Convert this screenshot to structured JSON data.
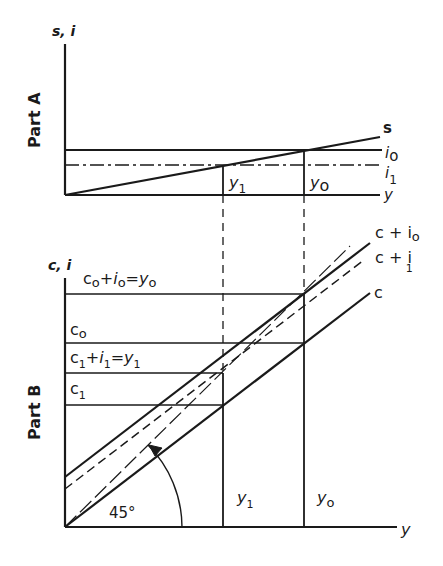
{
  "part_a": {
    "panel_label": "Part A",
    "y_axis_label": "s, i",
    "x_axis_label": "y",
    "curves": {
      "s": "s",
      "i0_main": "i",
      "i0_sub": "o",
      "i1_main": "i",
      "i1_sub": "1"
    },
    "markers": {
      "y1_main": "y",
      "y1_sub": "1",
      "y0_main": "y",
      "y0_sub": "o"
    }
  },
  "part_b": {
    "panel_label": "Part B",
    "y_axis_label": "c, i",
    "x_axis_label": "y",
    "levels": {
      "top": [
        "c",
        "o",
        "+",
        "i",
        "o",
        "=",
        "y",
        "o"
      ],
      "c0": [
        "c",
        "o"
      ],
      "mid": [
        "c",
        "1",
        "+",
        "i",
        "1",
        "=",
        "y",
        "1"
      ],
      "c1": [
        "c",
        "1"
      ]
    },
    "curves": {
      "c_plus_i0": "c + i",
      "c_plus_i0_sub": "o",
      "c_plus_i1": "c + i",
      "c_plus_i1_sub": "1",
      "c": "c"
    },
    "angle_label": "45°",
    "markers": {
      "y1_main": "y",
      "y1_sub": "1",
      "y0_main": "y",
      "y0_sub": "o"
    }
  },
  "colors": {
    "ink": "#1a1a1a",
    "background": "#ffffff"
  }
}
